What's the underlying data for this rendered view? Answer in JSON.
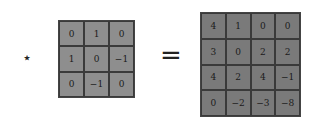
{
  "operators": {
    "convolve": "⋆",
    "equals": "="
  },
  "kernel": {
    "rows": [
      [
        "0",
        "1",
        "0"
      ],
      [
        "1",
        "0",
        "−1"
      ],
      [
        "0",
        "−1",
        "0"
      ]
    ]
  },
  "result": {
    "rows": [
      [
        "4",
        "1",
        "0",
        "0"
      ],
      [
        "3",
        "0",
        "2",
        "2"
      ],
      [
        "4",
        "2",
        "4",
        "−1"
      ],
      [
        "0",
        "−2",
        "−3",
        "−8"
      ]
    ]
  },
  "colors": {
    "kernel_bg": "#8e8e8e",
    "result_bg": "#7a7a7a",
    "grid_line": "#3a3a3a"
  }
}
